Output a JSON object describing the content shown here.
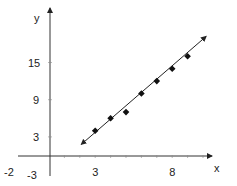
{
  "chart_data": {
    "type": "scatter",
    "title": "",
    "xlabel": "x",
    "ylabel": "y",
    "x_ticks": [
      3,
      8
    ],
    "y_ticks": [
      3,
      9,
      15
    ],
    "extra_tick_labels": {
      "x_negative": "-2",
      "y_negative": "-3"
    },
    "xlim": [
      -2,
      11
    ],
    "ylim": [
      -3,
      21
    ],
    "grid": false,
    "legend": null,
    "series": [
      {
        "name": "points",
        "type": "scatter",
        "marker": "diamond",
        "x": [
          3,
          4,
          5,
          6,
          7,
          8,
          9
        ],
        "y": [
          4,
          6,
          7,
          10,
          12,
          14,
          16
        ]
      },
      {
        "name": "line of best fit",
        "type": "line",
        "arrows": "both",
        "x": [
          2.1,
          10.2
        ],
        "y": [
          1.8,
          19.2
        ]
      }
    ]
  },
  "axes": {
    "x_label": "x",
    "y_label": "y",
    "x_tick_labels": [
      "-2",
      "3",
      "8"
    ],
    "y_tick_labels": [
      "-3",
      "3",
      "9",
      "15"
    ]
  },
  "colors": {
    "ink": "#222222",
    "background": "#ffffff"
  }
}
